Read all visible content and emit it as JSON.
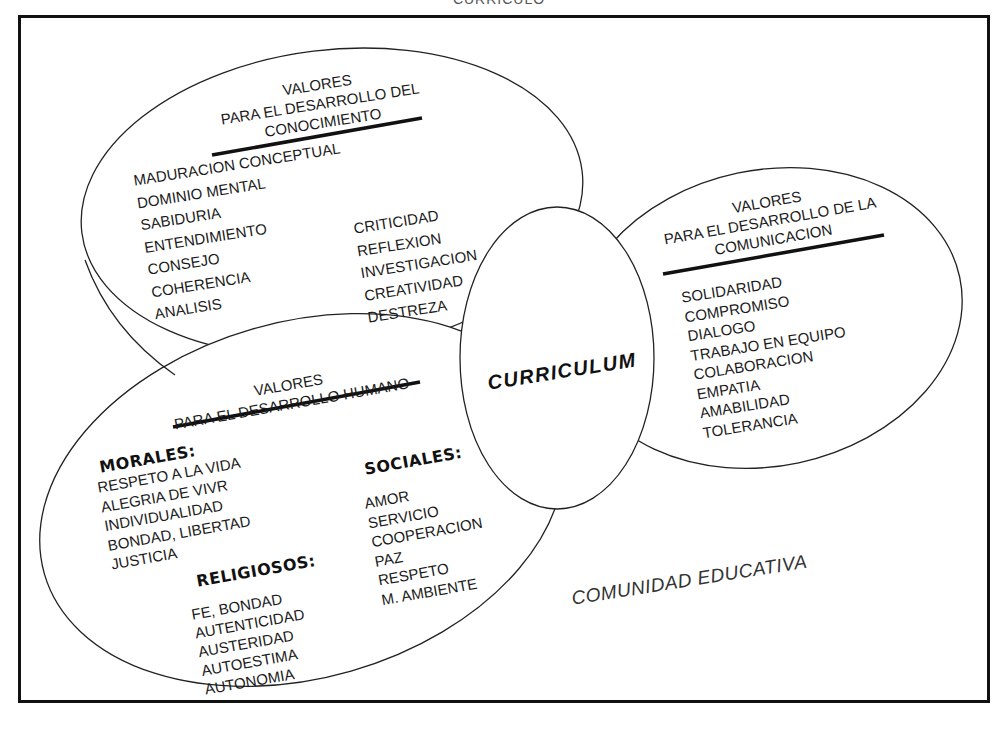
{
  "page": {
    "top_cut_text": "CURRICULO"
  },
  "knowledge": {
    "title_line1": "VALORES",
    "title_line2": "PARA EL DESARROLLO DEL",
    "title_line3": "CONOCIMIENTO",
    "col1": [
      "MADURACION CONCEPTUAL",
      "DOMINIO MENTAL",
      "SABIDURIA",
      "ENTENDIMIENTO",
      "CONSEJO",
      "COHERENCIA",
      "ANALISIS"
    ],
    "col2": [
      "CRITICIDAD",
      "REFLEXION",
      "INVESTIGACION",
      "CREATIVIDAD",
      "DESTREZA"
    ]
  },
  "communication": {
    "title_line1": "VALORES",
    "title_line2": "PARA EL DESARROLLO DE LA",
    "title_line3": "COMUNICACION",
    "items": [
      "SOLIDARIDAD",
      "COMPROMISO",
      "DIALOGO",
      "TRABAJO EN EQUIPO",
      "COLABORACION",
      "EMPATIA",
      "AMABILIDAD",
      "TOLERANCIA"
    ]
  },
  "human": {
    "title_line1": "VALORES",
    "title_line2": "PARA EL DESARROLLO HUMANO",
    "morales": {
      "label": "MORALES:",
      "items": [
        "RESPETO A LA VIDA",
        "ALEGRIA DE VIVR",
        "INDIVIDUALIDAD",
        "BONDAD, LIBERTAD",
        "JUSTICIA"
      ]
    },
    "religiosos": {
      "label": "RELIGIOSOS:",
      "items": [
        "FE,  BONDAD",
        "AUTENTICIDAD",
        "AUSTERIDAD",
        "AUTOESTIMA",
        "AUTONOMIA"
      ]
    },
    "sociales": {
      "label": "SOCIALES:",
      "items": [
        "AMOR",
        "SERVICIO",
        "COOPERACION",
        "PAZ",
        "RESPETO",
        "M. AMBIENTE"
      ]
    }
  },
  "center": {
    "label": "CURRICULUM"
  },
  "footer": {
    "label": "COMUNIDAD EDUCATIVA"
  },
  "colors": {
    "line": "#111111",
    "background": "#ffffff",
    "text": "#1a1a1a"
  }
}
